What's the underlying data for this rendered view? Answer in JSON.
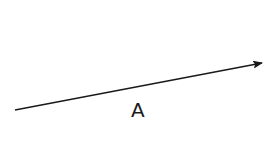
{
  "diagram": {
    "vector": {
      "label": "A",
      "start": [
        15,
        110
      ],
      "end": [
        263,
        63
      ],
      "color": "#1a1a1a"
    }
  }
}
